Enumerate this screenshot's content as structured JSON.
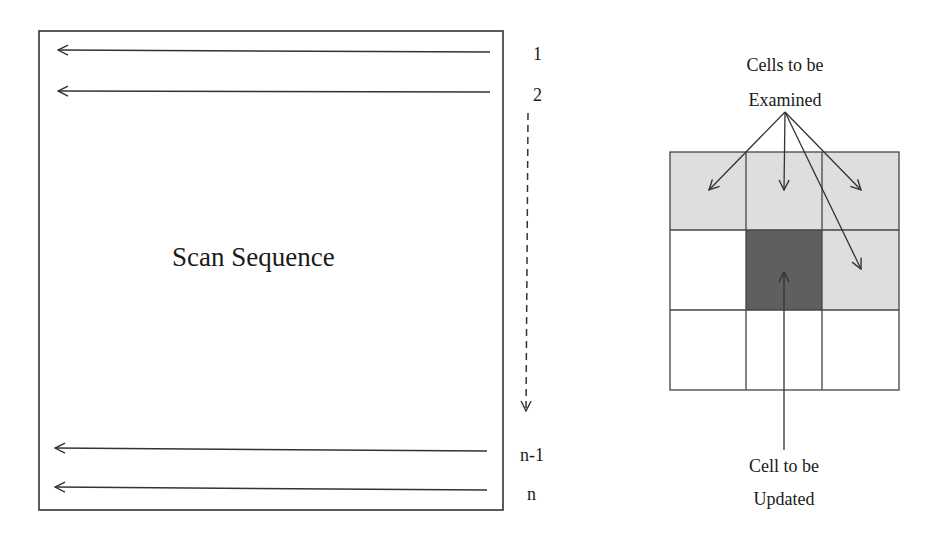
{
  "scan_panel": {
    "title": "Scan Sequence",
    "row_labels": [
      "1",
      "2",
      "n-1",
      "n"
    ],
    "scan_direction": "right-to-left",
    "progression": "top-to-bottom (dashed arrow)"
  },
  "neighborhood_panel": {
    "top_label_line1": "Cells to be",
    "top_label_line2": "Examined",
    "bottom_label_line1": "Cell to be",
    "bottom_label_line2": "Updated",
    "grid": {
      "rows": 3,
      "cols": 3,
      "cells": [
        [
          "examined",
          "examined",
          "examined"
        ],
        [
          "empty",
          "updated",
          "examined"
        ],
        [
          "empty",
          "empty",
          "empty"
        ]
      ]
    }
  },
  "colors": {
    "examined_fill": "#dedede",
    "updated_fill": "#5f5f5f",
    "empty_fill": "#ffffff",
    "line": "#333333"
  }
}
